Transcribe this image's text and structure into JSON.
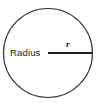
{
  "figure": {
    "type": "geometry-diagram",
    "background_color": "#ffffff",
    "stroke_color": "#3a3a3a",
    "line_color": "#1c1c1c",
    "text_color": "#1c1c1c"
  },
  "labels": {
    "radius_word": "Radius",
    "radius_symbol": "r"
  },
  "shape": {
    "circle": {
      "center_x": 48,
      "center_y": 53,
      "radius": 45
    },
    "radius_line": {
      "x1": 48,
      "y1": 53,
      "x2": 92,
      "y2": 53
    }
  },
  "text_positions": {
    "radius_word_x": 10,
    "radius_word_y": 53,
    "radius_symbol_x": 66,
    "radius_symbol_y": 45
  }
}
